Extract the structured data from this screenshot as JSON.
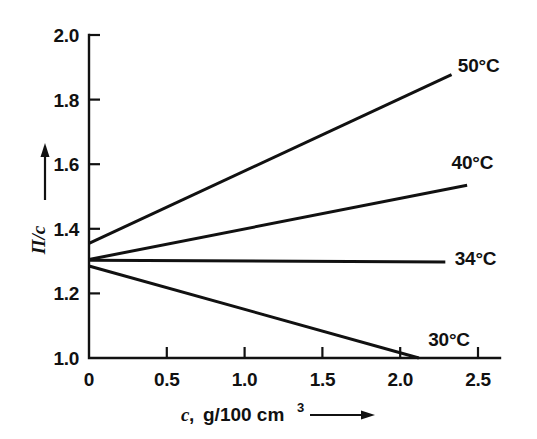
{
  "chart_data": {
    "type": "line",
    "title": "",
    "subtitle": "",
    "xlabel": "c, g/100 cm3",
    "xlabel_main": "c",
    "xlabel_sep": ",",
    "xlabel_units": "g/100 cm",
    "xlabel_units_sup": "3",
    "ylabel": "Π/c",
    "xlim": [
      0,
      2.5
    ],
    "ylim": [
      1.0,
      2.0
    ],
    "xticks": [
      "0",
      "0.5",
      "1.0",
      "1.5",
      "2.0",
      "2.5"
    ],
    "xtick_values": [
      0,
      0.5,
      1.0,
      1.5,
      2.0,
      2.5
    ],
    "yticks": [
      "1.0",
      "1.2",
      "1.4",
      "1.6",
      "1.8",
      "2.0"
    ],
    "ytick_values": [
      1.0,
      1.2,
      1.4,
      1.6,
      1.8,
      2.0
    ],
    "grid": false,
    "legend_position": "right-inline",
    "tick_direction": "in",
    "axis_arrows": {
      "x_arrow": true,
      "y_arrow": true
    },
    "series": [
      {
        "name": "50°C",
        "label": "50°C",
        "color": "#111111",
        "x": [
          0,
          2.33
        ],
        "y": [
          1.355,
          1.877
        ],
        "label_x": 2.37,
        "label_y": 1.905
      },
      {
        "name": "40°C",
        "label": "40°C",
        "color": "#111111",
        "x": [
          0,
          2.43
        ],
        "y": [
          1.305,
          1.535
        ],
        "label_x": 2.33,
        "label_y": 1.605
      },
      {
        "name": "34°C",
        "label": "34°C",
        "color": "#111111",
        "x": [
          0,
          2.29
        ],
        "y": [
          1.303,
          1.297
        ],
        "label_x": 2.35,
        "label_y": 1.305
      },
      {
        "name": "30°C",
        "label": "30°C",
        "color": "#111111",
        "x": [
          0,
          2.12
        ],
        "y": [
          1.285,
          1.0
        ],
        "label_x": 2.18,
        "label_y": 1.055
      }
    ]
  }
}
